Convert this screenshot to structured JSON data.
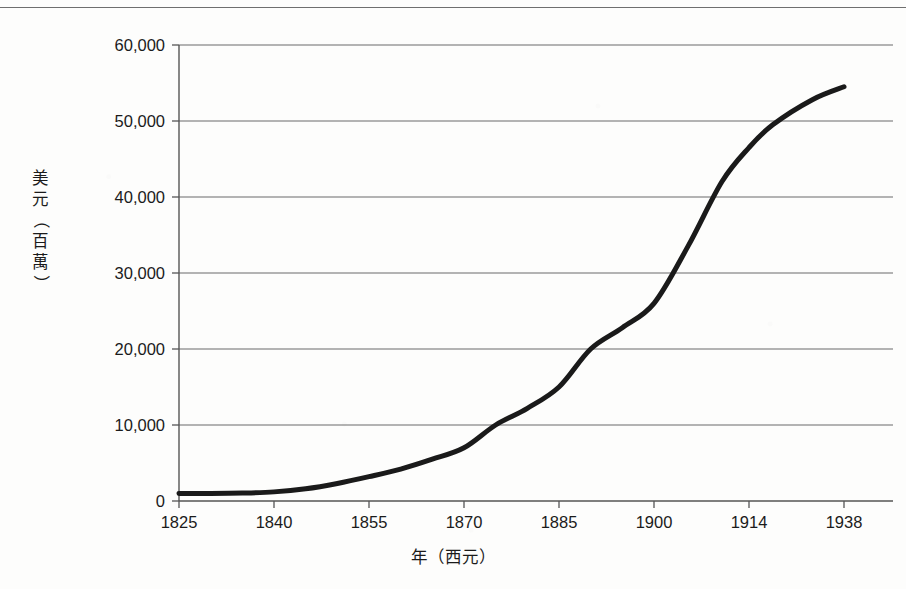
{
  "chart_data": {
    "type": "line",
    "title": "",
    "xlabel": "年（西元）",
    "ylabel": "美元（百萬）",
    "xlabel_chars": [
      "年",
      "（",
      "西",
      "元",
      "）"
    ],
    "ylabel_chars": [
      "美",
      "元",
      "（",
      "百",
      "萬",
      "）"
    ],
    "x_tick_labels": [
      "1825",
      "1840",
      "1855",
      "1870",
      "1885",
      "1900",
      "1914",
      "1938"
    ],
    "x_tick_values": [
      1825,
      1840,
      1855,
      1870,
      1885,
      1900,
      1914,
      1938
    ],
    "y_tick_labels": [
      "0",
      "10,000",
      "20,000",
      "30,000",
      "40,000",
      "50,000",
      "60,000"
    ],
    "y_tick_values": [
      0,
      10000,
      20000,
      30000,
      40000,
      50000,
      60000
    ],
    "ylim": [
      0,
      60000
    ],
    "grid": "horizontal",
    "legend": "none",
    "line_color": "#1a1a1a",
    "line_width": 5,
    "axis_color": "#555555",
    "grid_color": "#6b6b6b",
    "background_color": "#fdfdfc",
    "categories": [
      "1825",
      "1840",
      "1855",
      "1870",
      "1885",
      "1900",
      "1914",
      "1938"
    ],
    "values": [
      1000,
      1200,
      3200,
      7000,
      15000,
      26000,
      46500,
      54500
    ],
    "series": [
      {
        "name": "美元（百萬）",
        "points": [
          {
            "x": 1825,
            "y": 1000
          },
          {
            "x": 1830,
            "y": 1000
          },
          {
            "x": 1835,
            "y": 1050
          },
          {
            "x": 1840,
            "y": 1200
          },
          {
            "x": 1845,
            "y": 1600
          },
          {
            "x": 1850,
            "y": 2300
          },
          {
            "x": 1855,
            "y": 3200
          },
          {
            "x": 1860,
            "y": 4200
          },
          {
            "x": 1865,
            "y": 5500
          },
          {
            "x": 1870,
            "y": 7000
          },
          {
            "x": 1875,
            "y": 10000
          },
          {
            "x": 1880,
            "y": 12200
          },
          {
            "x": 1885,
            "y": 15000
          },
          {
            "x": 1890,
            "y": 20000
          },
          {
            "x": 1895,
            "y": 22800
          },
          {
            "x": 1900,
            "y": 26000
          },
          {
            "x": 1905,
            "y": 33500
          },
          {
            "x": 1910,
            "y": 42000
          },
          {
            "x": 1914,
            "y": 46500
          },
          {
            "x": 1920,
            "y": 49500
          },
          {
            "x": 1930,
            "y": 52800
          },
          {
            "x": 1938,
            "y": 54500
          }
        ]
      }
    ],
    "annotations": []
  },
  "figure": {
    "top_rule": true
  }
}
